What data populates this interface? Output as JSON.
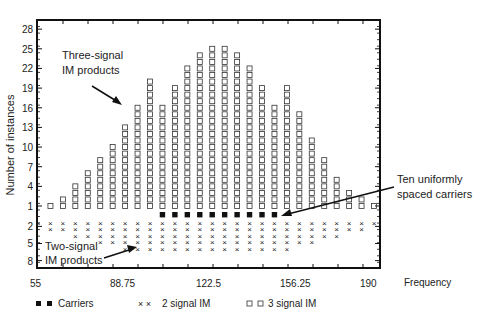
{
  "chart_data": {
    "type": "scatter",
    "title": "",
    "xlabel": "Frequency",
    "ylabel": "Number of instances",
    "x_ticks": [
      "55",
      "88.75",
      "122.5",
      "156.25",
      "190"
    ],
    "y_ticks_upper": [
      "28",
      "25",
      "22",
      "19",
      "16",
      "13",
      "10",
      "7",
      "4",
      "1"
    ],
    "y_ticks_lower": [
      "2",
      "5",
      "8"
    ],
    "xlim": [
      55,
      190
    ],
    "legend": [
      {
        "name": "Carriers",
        "marker": "filled-square"
      },
      {
        "name": "2 signal IM",
        "marker": "x"
      },
      {
        "name": "3 signal IM",
        "marker": "open-square"
      }
    ],
    "columns": 28,
    "series": [
      {
        "name": "3 signal IM",
        "values": [
          0,
          1,
          2,
          4,
          6,
          8,
          10,
          13,
          16,
          20,
          16,
          19,
          22,
          24,
          25,
          25,
          24,
          22,
          19,
          16,
          19,
          15,
          11,
          8,
          5,
          3,
          2,
          1
        ]
      },
      {
        "name": "2 signal IM",
        "values": [
          1,
          2,
          2,
          3,
          3,
          4,
          4,
          5,
          5,
          5,
          5,
          5,
          5,
          5,
          5,
          5,
          5,
          5,
          5,
          5,
          5,
          4,
          4,
          3,
          3,
          2,
          2,
          1
        ]
      },
      {
        "name": "Carriers",
        "values": [
          0,
          0,
          0,
          0,
          0,
          0,
          0,
          0,
          0,
          0,
          1,
          1,
          1,
          1,
          1,
          1,
          1,
          1,
          1,
          1,
          0,
          0,
          0,
          0,
          0,
          0,
          0,
          0
        ]
      }
    ],
    "annotations": [
      {
        "text": "Three-signal IM products",
        "lines": [
          "Three-signal",
          "IM products"
        ]
      },
      {
        "text": "Two-signal IM products",
        "lines": [
          "Two-signal",
          "IM products"
        ]
      },
      {
        "text": "Ten uniformly spaced carriers",
        "lines": [
          "Ten uniformly",
          "spaced carriers"
        ]
      }
    ]
  },
  "labels": {
    "ylabel": "Number of instances",
    "xlabel": "Frequency",
    "three_signal_1": "Three-signal",
    "three_signal_2": "IM products",
    "two_signal_1": "Two-signal",
    "two_signal_2": "IM products",
    "carriers_1": "Ten uniformly",
    "carriers_2": "spaced carriers",
    "legend_carriers": "Carriers",
    "legend_2sig": "2 signal IM",
    "legend_3sig": "3 signal IM"
  }
}
